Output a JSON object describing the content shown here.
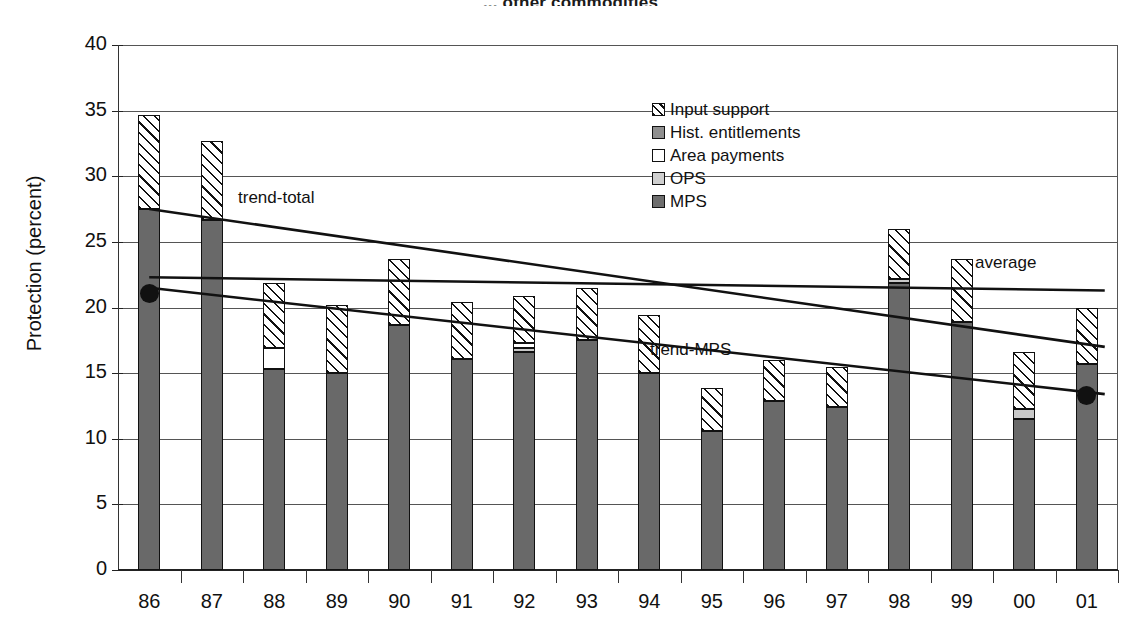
{
  "title": "... other commodities",
  "axis": {
    "ylabel": "Protection (percent)",
    "yticks": [
      "0",
      "5",
      "10",
      "15",
      "20",
      "25",
      "30",
      "35",
      "40"
    ],
    "xticks": [
      "86",
      "87",
      "88",
      "89",
      "90",
      "91",
      "92",
      "93",
      "94",
      "95",
      "96",
      "97",
      "98",
      "99",
      "00",
      "01"
    ]
  },
  "legend": {
    "items": [
      {
        "key": "input",
        "label": "Input support"
      },
      {
        "key": "hist",
        "label": "Hist. entitlements"
      },
      {
        "key": "area",
        "label": "Area payments"
      },
      {
        "key": "ops",
        "label": "OPS"
      },
      {
        "key": "mps",
        "label": "MPS"
      }
    ]
  },
  "annotations": {
    "trend_total": "trend-total",
    "trend_mps": "trend-MPS",
    "average": "average"
  },
  "chart_data": {
    "type": "bar",
    "stacked": true,
    "title": "... other commodities",
    "xlabel": "",
    "ylabel": "Protection (percent)",
    "ylim": [
      0,
      40
    ],
    "ytick_step": 5,
    "grid": true,
    "legend_position": "inside-top-right",
    "categories": [
      "86",
      "87",
      "88",
      "89",
      "90",
      "91",
      "92",
      "93",
      "94",
      "95",
      "96",
      "97",
      "98",
      "99",
      "00",
      "01"
    ],
    "series": [
      {
        "name": "MPS",
        "key": "mps",
        "values": [
          27.5,
          26.7,
          15.3,
          15.0,
          18.7,
          16.1,
          16.6,
          17.5,
          15.0,
          10.6,
          12.9,
          12.4,
          21.9,
          18.9,
          11.5,
          15.7
        ]
      },
      {
        "name": "OPS",
        "key": "ops",
        "values": [
          0.0,
          0.0,
          0.0,
          0.0,
          0.0,
          0.0,
          0.3,
          0.0,
          0.0,
          0.0,
          0.0,
          0.0,
          0.3,
          0.0,
          0.8,
          0.0
        ]
      },
      {
        "name": "Area payments",
        "key": "area",
        "values": [
          0.0,
          0.0,
          1.6,
          0.0,
          0.0,
          0.0,
          0.4,
          0.0,
          0.0,
          0.0,
          0.0,
          0.0,
          0.0,
          0.0,
          0.0,
          0.0
        ]
      },
      {
        "name": "Hist. entitlements",
        "key": "hist",
        "values": [
          0.0,
          0.0,
          0.0,
          0.0,
          0.0,
          0.0,
          0.0,
          0.0,
          0.0,
          0.0,
          0.0,
          0.0,
          0.0,
          0.0,
          0.0,
          0.0
        ]
      },
      {
        "name": "Input support",
        "key": "input",
        "values": [
          7.2,
          6.0,
          5.0,
          5.2,
          5.0,
          4.3,
          3.6,
          4.0,
          4.4,
          3.3,
          3.1,
          3.1,
          3.8,
          4.8,
          4.3,
          4.3
        ]
      }
    ],
    "totals": [
      34.7,
      32.7,
      21.9,
      20.2,
      23.7,
      20.4,
      20.9,
      21.5,
      19.4,
      13.9,
      16.0,
      15.5,
      26.0,
      23.7,
      16.6,
      20.0
    ],
    "trendlines": [
      {
        "name": "trend-total",
        "x0": "86",
        "y0": 27.5,
        "x1": "01",
        "y1": 17.0
      },
      {
        "name": "average",
        "x0": "86",
        "y0": 22.3,
        "x1": "01",
        "y1": 21.3
      },
      {
        "name": "trend-MPS",
        "x0": "86",
        "y0": 21.5,
        "x1": "01",
        "y1": 13.4
      }
    ],
    "markers": [
      {
        "x": "86",
        "y": 21.1
      },
      {
        "x": "01",
        "y": 13.3
      }
    ]
  }
}
